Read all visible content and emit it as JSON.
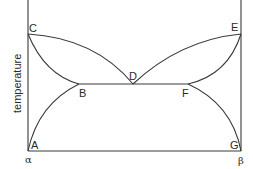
{
  "diagram": {
    "type": "binary phase diagram (eutectic)",
    "y_axis_label": "temperature",
    "x_axis_left_label": "α",
    "x_axis_right_label": "β",
    "points": {
      "A": "A",
      "B": "B",
      "C": "C",
      "D": "D",
      "E": "E",
      "F": "F",
      "G": "G"
    },
    "curves": [
      {
        "name": "C-D liquidus",
        "from": "C",
        "to": "D"
      },
      {
        "name": "D-E liquidus",
        "from": "D",
        "to": "E"
      },
      {
        "name": "C-B solidus",
        "from": "C",
        "to": "B"
      },
      {
        "name": "E-F solidus",
        "from": "E",
        "to": "F"
      },
      {
        "name": "B-F eutectic line",
        "from": "B",
        "to": "F"
      },
      {
        "name": "A-B solvus",
        "from": "A",
        "to": "B"
      },
      {
        "name": "G-F solvus",
        "from": "G",
        "to": "F"
      }
    ],
    "line_color": "#3a3a3a"
  }
}
